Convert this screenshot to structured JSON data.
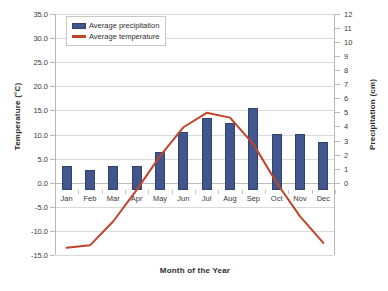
{
  "chart_data": {
    "type": "bar",
    "title": "",
    "xlabel": "Month of the Year",
    "ylabel": "Temperature (°C)",
    "y2label": "Precipitation (cm)",
    "categories": [
      "Jan",
      "Feb",
      "Mar",
      "Apr",
      "May",
      "Jun",
      "Jul",
      "Aug",
      "Sep",
      "Oct",
      "Nov",
      "Dec"
    ],
    "ylim": [
      -15.0,
      35.0
    ],
    "y2lim": [
      0,
      12
    ],
    "yticks": [
      "35.0",
      "30.0",
      "25.0",
      "20.0",
      "15.0",
      "10.0",
      "5.0",
      "0.0",
      "-5.0",
      "-10.0",
      "-15.0"
    ],
    "ytick_values": [
      35,
      30,
      25,
      20,
      15,
      10,
      5,
      0,
      -5,
      -10,
      -15
    ],
    "y2ticks": [
      "12",
      "11",
      "10",
      "9",
      "8",
      "7",
      "6",
      "5",
      "4",
      "3",
      "2",
      "1",
      "0"
    ],
    "y2tick_values": [
      12,
      11,
      10,
      9,
      8,
      7,
      6,
      5,
      4,
      3,
      2,
      1,
      0
    ],
    "grid": true,
    "legend_position": "top-left",
    "series": [
      {
        "name": "Average precipitation",
        "type": "bar",
        "axis": "right",
        "unit": "cm",
        "color": "#41568C",
        "values": [
          1.7,
          1.4,
          1.7,
          1.7,
          2.7,
          4.1,
          5.1,
          4.8,
          5.8,
          4.0,
          4.0,
          3.4
        ]
      },
      {
        "name": "Average temperature",
        "type": "line",
        "axis": "left",
        "unit": "°C",
        "color": "#C0432A",
        "values": [
          -13.5,
          -13.0,
          -8.0,
          -1.5,
          5.5,
          11.5,
          14.5,
          13.5,
          8.0,
          0.0,
          -7.0,
          -12.5
        ]
      }
    ]
  },
  "legend": {
    "items": [
      {
        "label": "Average precipitation",
        "marker": "bar-swatch"
      },
      {
        "label": "Average temperature",
        "marker": "line-swatch"
      }
    ]
  },
  "colors": {
    "bar": "#41568C",
    "line": "#C0432A",
    "grid": "#D9D9D9",
    "axis": "#B8B8B8",
    "text": "#2E2E2E",
    "background": "#FFFFFF"
  }
}
